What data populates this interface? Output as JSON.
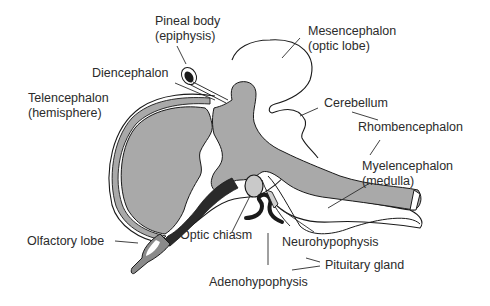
{
  "diagram": {
    "type": "anatomical-illustration",
    "colors": {
      "tissue_fill": "#a9a9a9",
      "dark_tissue": "#2a2a2a",
      "outline": "#1a1a1a",
      "background": "#ffffff",
      "label_text": "#2b2b2b"
    },
    "labels": {
      "pineal_line1": "Pineal body",
      "pineal_line2": "(epiphysis)",
      "mesencephalon_line1": "Mesencephalon",
      "mesencephalon_line2": "(optic lobe)",
      "diencephalon": "Diencephalon",
      "telencephalon_line1": "Telencephalon",
      "telencephalon_line2": "(hemisphere)",
      "cerebellum": "Cerebellum",
      "rhombencephalon": "Rhombencephalon",
      "myelencephalon_line1": "Myelencephalon",
      "myelencephalon_line2": "(medulla)",
      "olfactory_lobe": "Olfactory lobe",
      "optic_chiasm": "Optic chiasm",
      "neurohypophysis": "Neurohypophysis",
      "pituitary_gland": "Pituitary gland",
      "adenohypophysis": "Adenohypophysis"
    }
  }
}
